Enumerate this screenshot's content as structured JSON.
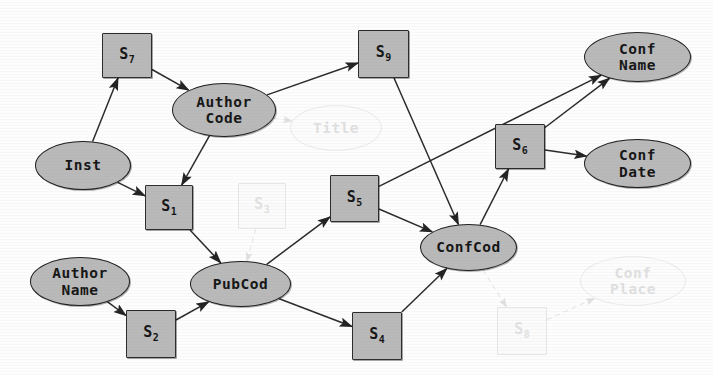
{
  "diagram": {
    "colors": {
      "node_fill": "#b9b9b9",
      "node_stroke": "#1d1d1d",
      "edge": "#2a2a2a",
      "ghost": "#e6e6e6",
      "background": "#fdfdfd"
    },
    "nodes": [
      {
        "id": "S7",
        "shape": "box",
        "label": "S",
        "sub": "7",
        "x": 102,
        "y": 33,
        "w": 50,
        "h": 45,
        "ghost": false
      },
      {
        "id": "S9",
        "shape": "box",
        "label": "S",
        "sub": "9",
        "x": 358,
        "y": 30,
        "w": 51,
        "h": 48,
        "ghost": false
      },
      {
        "id": "S6",
        "shape": "box",
        "label": "S",
        "sub": "6",
        "x": 495,
        "y": 124,
        "w": 50,
        "h": 45,
        "ghost": false
      },
      {
        "id": "S1",
        "shape": "box",
        "label": "S",
        "sub": "1",
        "x": 145,
        "y": 185,
        "w": 48,
        "h": 45,
        "ghost": false
      },
      {
        "id": "S5",
        "shape": "box",
        "label": "S",
        "sub": "5",
        "x": 330,
        "y": 175,
        "w": 49,
        "h": 47,
        "ghost": false
      },
      {
        "id": "S2",
        "shape": "box",
        "label": "S",
        "sub": "2",
        "x": 126,
        "y": 310,
        "w": 50,
        "h": 48,
        "ghost": false
      },
      {
        "id": "S4",
        "shape": "box",
        "label": "S",
        "sub": "4",
        "x": 352,
        "y": 312,
        "w": 50,
        "h": 48,
        "ghost": false
      },
      {
        "id": "S3",
        "shape": "box",
        "label": "S",
        "sub": "3",
        "x": 238,
        "y": 183,
        "w": 48,
        "h": 46,
        "ghost": true
      },
      {
        "id": "S8",
        "shape": "box",
        "label": "S",
        "sub": "8",
        "x": 497,
        "y": 307,
        "w": 50,
        "h": 48,
        "ghost": true
      },
      {
        "id": "Inst",
        "shape": "ellipse",
        "label": "Inst",
        "sub": "",
        "x": 35,
        "y": 141,
        "w": 96,
        "h": 49,
        "ghost": false
      },
      {
        "id": "AuthorCode",
        "shape": "ellipse",
        "label": "Author\nCode",
        "sub": "",
        "x": 172,
        "y": 83,
        "w": 104,
        "h": 54,
        "ghost": false
      },
      {
        "id": "AuthorName",
        "shape": "ellipse",
        "label": "Author\nName",
        "sub": "",
        "x": 30,
        "y": 257,
        "w": 100,
        "h": 49,
        "ghost": false
      },
      {
        "id": "PubCod",
        "shape": "ellipse",
        "label": "PubCod",
        "sub": "",
        "x": 190,
        "y": 261,
        "w": 101,
        "h": 46,
        "ghost": false
      },
      {
        "id": "ConfCod",
        "shape": "ellipse",
        "label": "ConfCod",
        "sub": "",
        "x": 420,
        "y": 224,
        "w": 97,
        "h": 47,
        "ghost": false
      },
      {
        "id": "ConfName",
        "shape": "ellipse",
        "label": "Conf\nName",
        "sub": "",
        "x": 584,
        "y": 32,
        "w": 107,
        "h": 50,
        "ghost": false
      },
      {
        "id": "ConfDate",
        "shape": "ellipse",
        "label": "Conf\nDate",
        "sub": "",
        "x": 584,
        "y": 139,
        "w": 107,
        "h": 49,
        "ghost": false
      },
      {
        "id": "ConfPlace",
        "shape": "ellipse",
        "label": "Conf\nPlace",
        "sub": "",
        "x": 580,
        "y": 256,
        "w": 106,
        "h": 50,
        "ghost": true
      }
    ],
    "edges": [
      {
        "from": "Inst",
        "to": "S7",
        "ghost": false
      },
      {
        "from": "S7",
        "to": "AuthorCode",
        "ghost": false
      },
      {
        "from": "AuthorCode",
        "to": "S9",
        "ghost": false
      },
      {
        "from": "AuthorCode",
        "to": "S1",
        "ghost": false
      },
      {
        "from": "Inst",
        "to": "S1",
        "ghost": false
      },
      {
        "from": "S1",
        "to": "PubCod",
        "ghost": false
      },
      {
        "from": "AuthorName",
        "to": "S2",
        "ghost": false
      },
      {
        "from": "S2",
        "to": "PubCod",
        "ghost": false
      },
      {
        "from": "PubCod",
        "to": "S5",
        "ghost": false
      },
      {
        "from": "PubCod",
        "to": "S4",
        "ghost": false
      },
      {
        "from": "S5",
        "to": "ConfCod",
        "ghost": false
      },
      {
        "from": "S4",
        "to": "ConfCod",
        "ghost": false
      },
      {
        "from": "S9",
        "to": "ConfCod",
        "ghost": false
      },
      {
        "from": "S5",
        "to": "ConfName",
        "ghost": false
      },
      {
        "from": "ConfCod",
        "to": "S6",
        "ghost": false
      },
      {
        "from": "S6",
        "to": "ConfName",
        "ghost": false
      },
      {
        "from": "S6",
        "to": "ConfDate",
        "ghost": false
      },
      {
        "from": "AuthorCode",
        "to": "Title",
        "ghost": true
      },
      {
        "from": "S3",
        "to": "PubCod",
        "ghost": true
      },
      {
        "from": "ConfCod",
        "to": "S8",
        "ghost": true
      },
      {
        "from": "S8",
        "to": "ConfPlace",
        "ghost": true
      }
    ],
    "ghost_nodes_extra": [
      {
        "id": "Title",
        "shape": "ellipse",
        "label": "Title",
        "sub": "",
        "x": 290,
        "y": 105,
        "w": 92,
        "h": 46,
        "ghost": true
      }
    ]
  }
}
